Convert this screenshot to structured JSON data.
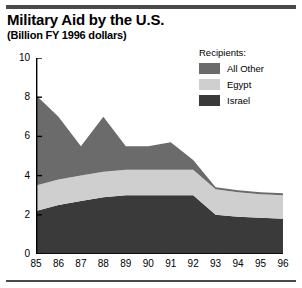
{
  "title": "Military Aid by the U.S.",
  "subtitle": "(Billion FY 1996 dollars)",
  "legend": {
    "heading": "Recipients:",
    "items": [
      {
        "label": "All Other",
        "color": "#6b6b6b"
      },
      {
        "label": "Egypt",
        "color": "#cfcfcf"
      },
      {
        "label": "Israel",
        "color": "#3a3a3a"
      }
    ]
  },
  "chart_data": {
    "type": "area",
    "stacked": true,
    "title": "Military Aid by the U.S.",
    "subtitle": "(Billion FY 1996 dollars)",
    "xlabel": "",
    "ylabel": "",
    "units": "Billion FY 1996 dollars",
    "grid": false,
    "legend_position": "top-right",
    "categories": [
      "85",
      "86",
      "87",
      "88",
      "89",
      "90",
      "91",
      "92",
      "93",
      "94",
      "95",
      "96"
    ],
    "x_tick_labels": [
      "85",
      "86",
      "87",
      "88",
      "89",
      "90",
      "91",
      "92",
      "93",
      "94",
      "95",
      "96"
    ],
    "y_tick_labels": [
      "0",
      "2",
      "4",
      "6",
      "8",
      "10"
    ],
    "ylim": [
      0,
      10
    ],
    "y_ticks": [
      0,
      2,
      4,
      6,
      8,
      10
    ],
    "series": [
      {
        "name": "Israel",
        "color": "#3a3a3a",
        "values": [
          2.2,
          2.5,
          2.7,
          2.9,
          3.0,
          3.0,
          3.0,
          3.0,
          2.0,
          1.9,
          1.85,
          1.8
        ]
      },
      {
        "name": "Egypt",
        "color": "#cfcfcf",
        "values": [
          1.3,
          1.3,
          1.3,
          1.3,
          1.3,
          1.3,
          1.3,
          1.3,
          1.3,
          1.25,
          1.2,
          1.2
        ]
      },
      {
        "name": "All Other",
        "color": "#6b6b6b",
        "values": [
          4.6,
          3.2,
          1.5,
          2.8,
          1.2,
          1.2,
          1.4,
          0.5,
          0.1,
          0.1,
          0.1,
          0.1
        ]
      }
    ],
    "totals": [
      8.1,
      7.0,
      5.5,
      7.0,
      5.5,
      5.5,
      5.7,
      4.8,
      3.4,
      3.25,
      3.15,
      3.1
    ]
  }
}
